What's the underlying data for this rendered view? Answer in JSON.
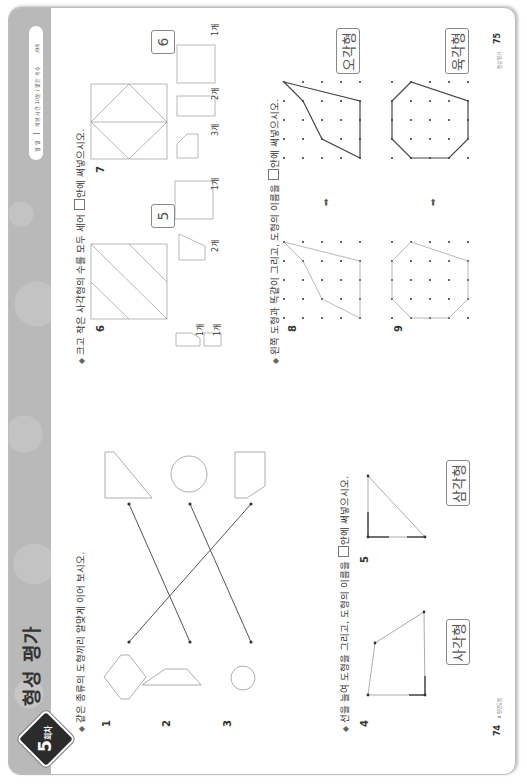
{
  "header": {
    "badge_number": "5",
    "badge_suffix": "회차",
    "title": "형성 평가",
    "date_label": "월   일",
    "time_limit": "제한 시간 10분 / 맞은 개수",
    "score_total": "/9개"
  },
  "sections": [
    {
      "instruction": "같은 종류의 도형끼리 알맞게 이어 보시오.",
      "problems": [
        {
          "number": "1",
          "left_shape": "hexagon",
          "right_shape": "trapezoid-slanted"
        },
        {
          "number": "2",
          "left_shape": "trapezoid",
          "right_shape": "circle"
        },
        {
          "number": "3",
          "left_shape": "circle",
          "right_shape": "pentagon-d-shape"
        }
      ],
      "connections": [
        [
          "1",
          "3"
        ],
        [
          "2",
          "1"
        ],
        [
          "3",
          "2"
        ]
      ]
    },
    {
      "instruction_pre": "선을 늘여 도형을 그리고, 도형의 이름을",
      "instruction_post": "안에 써넣으시오.",
      "problems": [
        {
          "number": "4",
          "answer": "사각형"
        },
        {
          "number": "5",
          "answer": "삼각형"
        }
      ]
    },
    {
      "instruction_pre": "크고 작은 사각형의 수를 모두 세어",
      "instruction_post": "안에 써넣으시오.",
      "problems": [
        {
          "number": "6",
          "answer": "5",
          "counts": [
            "1개",
            "1개",
            "2개",
            "1개"
          ]
        },
        {
          "number": "7",
          "answer": "6",
          "counts": [
            "3개",
            "2개",
            "1개"
          ]
        }
      ]
    },
    {
      "instruction_pre": "왼쪽 도형과 똑같이 그리고, 도형의 이름을",
      "instruction_post": "안에 써넣으시오.",
      "problems": [
        {
          "number": "8",
          "answer": "오각형"
        },
        {
          "number": "9",
          "answer": "육각형"
        }
      ]
    }
  ],
  "footer": {
    "left_page": "74",
    "left_label": "Ⅱ 평면도형",
    "right_page": "75",
    "right_label": "형성 평가"
  }
}
